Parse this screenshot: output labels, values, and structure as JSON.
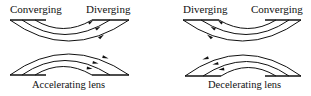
{
  "diagrams": [
    {
      "caption": "Accelerating lens",
      "top_left_label": "Converging",
      "top_right_label": "Diverging",
      "arrow_direction": "right"
    },
    {
      "caption": "Decelerating lens",
      "top_left_label": "Diverging",
      "top_right_label": "Converging",
      "arrow_direction": "left"
    }
  ],
  "colors": {
    "line": "#111111",
    "background": "#ffffff"
  }
}
